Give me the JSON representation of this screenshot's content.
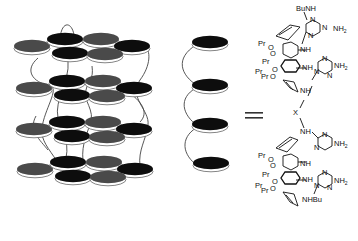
{
  "figure": {
    "stack": {
      "layers": 4,
      "discs_per_layer": 6,
      "disc_colors": {
        "black": "#0d0d0d",
        "gray": "#4a4a4a",
        "rim": "#ffffff",
        "outline": "#555555"
      }
    },
    "column": {
      "discs": 4
    },
    "equals_sign": "=",
    "structure": {
      "top_substituent": "BuNH",
      "bottom_substituent": "NHBu",
      "amine_label": "NH",
      "nh2_label": "NH",
      "nh2_subscript": "2",
      "triazine_atom": "N",
      "linker": "X",
      "propyl_label": "Pr",
      "oxygen_label": "O"
    }
  }
}
